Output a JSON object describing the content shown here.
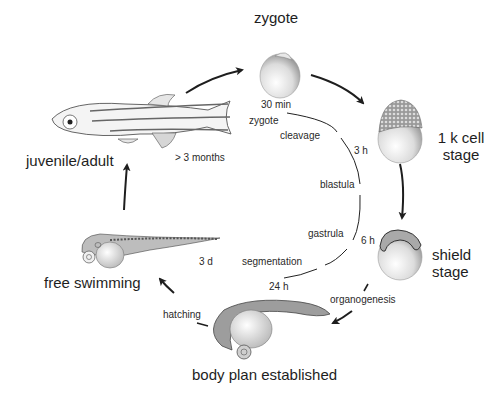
{
  "stages": {
    "zygote": "zygote",
    "k_cell_line1": "1 k cell",
    "k_cell_line2": "stage",
    "shield_line1": "shield",
    "shield_line2": "stage",
    "body_plan": "body plan established",
    "free_swimming": "free swimming",
    "juvenile_adult": "juvenile/adult"
  },
  "timeline": {
    "times": {
      "t_30min": "30 min",
      "t_3h": "3 h",
      "t_6h": "6 h",
      "t_24h": "24 h",
      "t_3d": "3 d",
      "t_3months": "> 3 months"
    },
    "periods": {
      "zygote": "zygote",
      "cleavage": "cleavage",
      "blastula": "blastula",
      "gastrula": "gastrula",
      "segmentation": "segmentation"
    }
  },
  "transitions": {
    "organogenesis": "organogenesis",
    "hatching": "hatching"
  },
  "colors": {
    "ink": "#1e1e1e",
    "background": "#ffffff",
    "embryo_shade": "#bdbdbd"
  }
}
